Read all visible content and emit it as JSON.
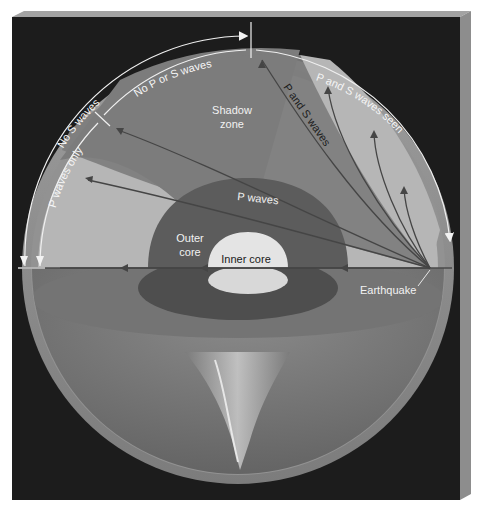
{
  "figure": {
    "colors": {
      "background_panel": "#1c1c1c",
      "panel_bevel_top": "#9a9a9a",
      "panel_bevel_side": "#8a8a8a",
      "crust": "#8c8c8c",
      "mantle_light": "#b4b4b4",
      "shadow_zone": "#7a7a7a",
      "outer_core": "#5a5a5a",
      "inner_core": "#e6e6e6",
      "lower_hemisphere": "#6e6e6e",
      "wave_line": "#3f3f3f",
      "arc_label_line": "#f0f0f0"
    }
  },
  "arc_labels": {
    "p_waves_only": "P waves only",
    "no_s_waves": "No S waves",
    "no_p_or_s_waves": "No P or S waves",
    "p_and_s_waves_seen": "P and S waves seen"
  },
  "region_labels": {
    "shadow_zone_line1": "Shadow",
    "shadow_zone_line2": "zone",
    "outer_core_line1": "Outer",
    "outer_core_line2": "core",
    "inner_core": "Inner core"
  },
  "wave_labels": {
    "p_waves": "P waves",
    "p_and_s_waves": "P and S waves"
  },
  "callouts": {
    "earthquake": "Earthquake"
  }
}
